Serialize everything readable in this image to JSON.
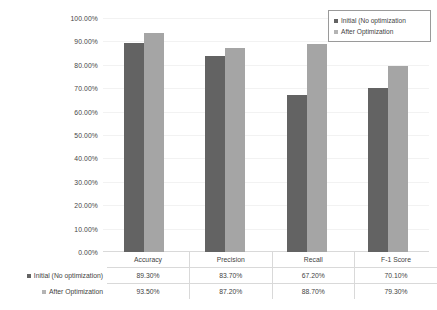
{
  "chart_data": {
    "type": "bar",
    "title": "",
    "xlabel": "",
    "ylabel": "",
    "ylim": [
      0,
      100
    ],
    "grid": true,
    "legend_position": "top-right",
    "categories": [
      "Accuracy",
      "Precision",
      "Recall",
      "F-1 Score"
    ],
    "series": [
      {
        "name": "Initial (No optimization)",
        "legend_label": "Initial (No optimization",
        "color": "#636363",
        "values": [
          89.3,
          83.7,
          67.2,
          70.1
        ],
        "labels": [
          "89.30%",
          "83.70%",
          "67.20%",
          "70.10%"
        ]
      },
      {
        "name": "After Optimization",
        "legend_label": "After Optimization",
        "color": "#a5a5a5",
        "values": [
          93.5,
          87.2,
          88.7,
          79.3
        ],
        "labels": [
          "93.50%",
          "87.20%",
          "88.70%",
          "79.30%"
        ]
      }
    ],
    "ytick_labels": [
      "100.00%",
      "90.00%",
      "80.00%",
      "70.00%",
      "60.00%",
      "50.00%",
      "40.00%",
      "30.00%",
      "20.00%",
      "10.00%",
      "0.00%"
    ],
    "ytick_values": [
      100,
      90,
      80,
      70,
      60,
      50,
      40,
      30,
      20,
      10,
      0
    ]
  },
  "legend": {
    "items": [
      {
        "label": "Initial (No optimization",
        "marker": "legend-marker-square"
      },
      {
        "label": "After Optimization",
        "marker": "legend-marker-square"
      }
    ]
  },
  "table": {
    "categories": [
      "Accuracy",
      "Precision",
      "Recall",
      "F-1 Score"
    ],
    "rows": [
      {
        "label": "Initial (No optimization)",
        "values": [
          "89.30%",
          "83.70%",
          "67.20%",
          "70.10%"
        ]
      },
      {
        "label": "After Optimization",
        "values": [
          "93.50%",
          "87.20%",
          "88.70%",
          "79.30%"
        ]
      }
    ]
  },
  "colors": {
    "series_initial": "#636363",
    "series_after": "#a5a5a5",
    "gridline": "#f2f2f2",
    "axis": "#d9d9d9",
    "text": "#3f3f3f"
  }
}
